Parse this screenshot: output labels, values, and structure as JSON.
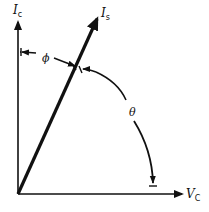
{
  "diagram": {
    "type": "phasor-diagram",
    "labels": {
      "vertical_axis": {
        "main": "I",
        "sub": "c"
      },
      "horizontal_axis": {
        "main": "V",
        "sub": "C"
      },
      "vector": {
        "main": "I",
        "sub": "s"
      },
      "phi": "ϕ",
      "theta": "θ"
    },
    "colors": {
      "stroke": "#111111",
      "background": "#ffffff"
    }
  }
}
